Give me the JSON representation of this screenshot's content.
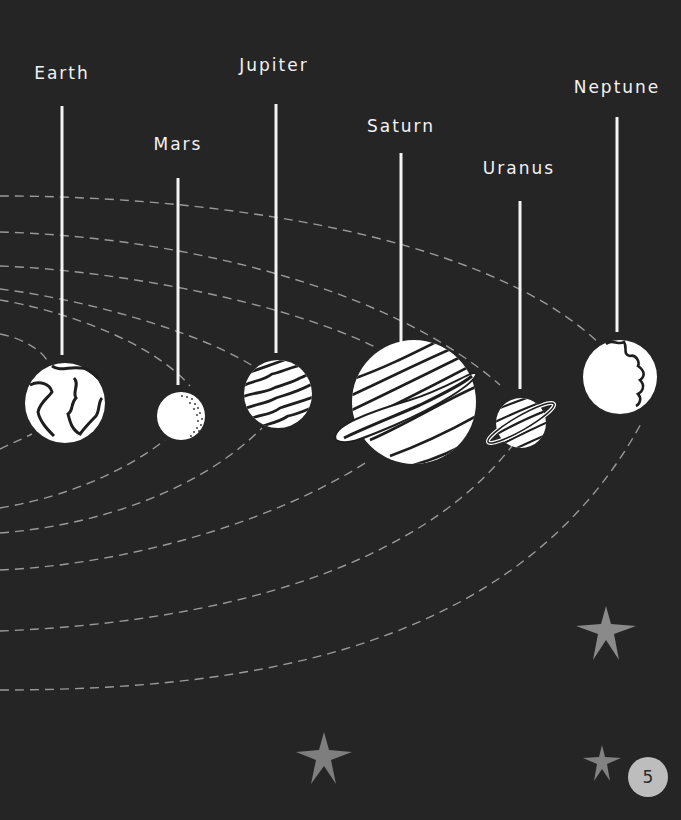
{
  "page": {
    "background_color": "#252525",
    "page_number": "5"
  },
  "planets": [
    {
      "name": "Earth",
      "label_x": 62,
      "label_y": 63,
      "string_top": 106,
      "string_bottom": 355,
      "cx": 65,
      "cy": 403,
      "r": 40,
      "style": "continents"
    },
    {
      "name": "Mars",
      "label_x": 178,
      "label_y": 135,
      "string_top": 178,
      "string_bottom": 385,
      "cx": 181,
      "cy": 416,
      "r": 24,
      "style": "dotted"
    },
    {
      "name": "Jupiter",
      "label_x": 274,
      "label_y": 56,
      "string_top": 104,
      "string_bottom": 353,
      "cx": 278,
      "cy": 394,
      "r": 34,
      "style": "wavy-bands"
    },
    {
      "name": "Saturn",
      "label_x": 401,
      "label_y": 116,
      "string_top": 153,
      "string_bottom": 342,
      "cx": 414,
      "cy": 402,
      "r": 62,
      "style": "ringed-large"
    },
    {
      "name": "Uranus",
      "label_x": 519,
      "label_y": 158,
      "string_top": 201,
      "string_bottom": 389,
      "cx": 521,
      "cy": 423,
      "r": 25,
      "style": "ringed-small"
    },
    {
      "name": "Neptune",
      "label_x": 617,
      "label_y": 77,
      "string_top": 117,
      "string_bottom": 332,
      "cx": 620,
      "cy": 377,
      "r": 37,
      "style": "jagged"
    }
  ],
  "stars": [
    {
      "cx": 606,
      "cy": 630,
      "size": 30,
      "color": "#8a8a8a"
    },
    {
      "cx": 324,
      "cy": 757,
      "size": 28,
      "color": "#7e7e7e"
    },
    {
      "cx": 602,
      "cy": 765,
      "size": 20,
      "color": "#828282"
    }
  ],
  "colors": {
    "planet_fill": "#ffffff",
    "planet_stroke": "#1e1e1e",
    "string": "#f4f4f4",
    "orbit": "#9a9a9a",
    "label": "#f2f2f2",
    "badge_bg": "#bdbdbd",
    "badge_text": "#2a2a2a"
  }
}
